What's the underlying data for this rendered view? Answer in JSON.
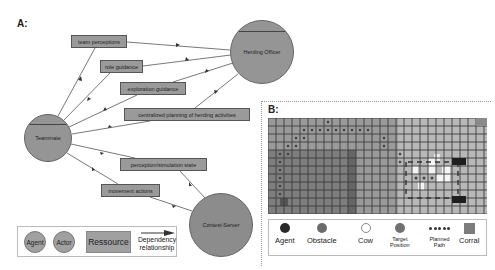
{
  "panel_a": {
    "label": "A:",
    "actors": [
      {
        "id": "teammate",
        "label": "Teammate",
        "cx": 48,
        "cy": 138,
        "r": 24
      },
      {
        "id": "herding_officer",
        "label": "Herding Officer",
        "cx": 262,
        "cy": 52,
        "r": 32
      },
      {
        "id": "contest_server",
        "label": "Contest-Server",
        "cx": 221,
        "cy": 225,
        "r": 32
      }
    ],
    "resources": [
      {
        "label": "team perceptions",
        "x": 71,
        "y": 35,
        "w": 56,
        "h": 13
      },
      {
        "label": "role guidance",
        "x": 100,
        "y": 60,
        "w": 43,
        "h": 13
      },
      {
        "label": "exploration guidance",
        "x": 120,
        "y": 82,
        "w": 66,
        "h": 13
      },
      {
        "label": "centralized planning of herding activities",
        "x": 124,
        "y": 108,
        "w": 126,
        "h": 13
      },
      {
        "label": "perception/simulation state",
        "x": 120,
        "y": 158,
        "w": 87,
        "h": 13
      },
      {
        "label": "movement actions",
        "x": 101,
        "y": 184,
        "w": 59,
        "h": 13
      }
    ],
    "legend": {
      "agent": "Agent",
      "actor": "Actor",
      "resource": "Ressource",
      "dependency_line1": "Dependency",
      "dependency_line2": "relationship"
    }
  },
  "panel_b": {
    "label": "B:",
    "legend": {
      "agent": "Agent",
      "obstacle": "Obstacle",
      "cow": "Cow",
      "target_line1": "Target",
      "target_line2": "Position",
      "path_line1": "Planned",
      "path_line2": "Path",
      "corral": "Corral"
    },
    "colors": {
      "agent": "#2a2a2a",
      "obstacle": "#6b6b6b",
      "cow": "#ffffff",
      "target": "#707070",
      "path": "#3a3a3a",
      "corral": "#7d7d7d",
      "grid_light": "#b3b3b3",
      "grid_dark": "#8a8a8a",
      "grid_darker": "#757575"
    }
  }
}
